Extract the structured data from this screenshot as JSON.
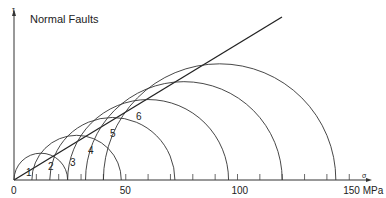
{
  "title": "Normal Faults",
  "axes": {
    "y_label": "τ",
    "x_label": "σ",
    "x_ticks": [
      {
        "v": 0,
        "label": "0"
      },
      {
        "v": 50,
        "label": "50"
      },
      {
        "v": 100,
        "label": "100"
      },
      {
        "v": 150,
        "label": "150 MPa"
      }
    ]
  },
  "circles": [
    {
      "label": "1",
      "sigma3": 0,
      "sigma1": 24
    },
    {
      "label": "2",
      "sigma3": 8,
      "sigma1": 48
    },
    {
      "label": "3",
      "sigma3": 16,
      "sigma1": 72
    },
    {
      "label": "4",
      "sigma3": 24,
      "sigma1": 96
    },
    {
      "label": "5",
      "sigma3": 32,
      "sigma1": 120
    },
    {
      "label": "6",
      "sigma3": 40,
      "sigma1": 144
    }
  ],
  "failure_envelope": {
    "slope": 0.577,
    "through_origin": true
  }
}
